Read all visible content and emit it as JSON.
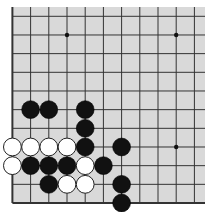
{
  "game": "go",
  "board_view": {
    "description": "Partial Go board, lower-left region with left and bottom edges visible",
    "visible_columns": 11,
    "visible_rows": 11,
    "edges_visible": [
      "left",
      "bottom"
    ],
    "board_color": "#d9d9d9",
    "line_color": "#333333"
  },
  "star_points": [
    {
      "col": 3,
      "row": 1
    },
    {
      "col": 9,
      "row": 1
    },
    {
      "col": 9,
      "row": 7
    }
  ],
  "stones": [
    {
      "color": "black",
      "col": 1,
      "row": 5
    },
    {
      "color": "black",
      "col": 2,
      "row": 5
    },
    {
      "color": "black",
      "col": 4,
      "row": 5
    },
    {
      "color": "black",
      "col": 4,
      "row": 6
    },
    {
      "color": "white",
      "col": 0,
      "row": 7
    },
    {
      "color": "white",
      "col": 1,
      "row": 7
    },
    {
      "color": "white",
      "col": 2,
      "row": 7
    },
    {
      "color": "white",
      "col": 3,
      "row": 7
    },
    {
      "color": "black",
      "col": 4,
      "row": 7
    },
    {
      "color": "black",
      "col": 6,
      "row": 7
    },
    {
      "color": "white",
      "col": 0,
      "row": 8
    },
    {
      "color": "black",
      "col": 1,
      "row": 8
    },
    {
      "color": "black",
      "col": 2,
      "row": 8
    },
    {
      "color": "black",
      "col": 3,
      "row": 8
    },
    {
      "color": "white",
      "col": 4,
      "row": 8
    },
    {
      "color": "black",
      "col": 5,
      "row": 8
    },
    {
      "color": "black",
      "col": 2,
      "row": 9
    },
    {
      "color": "white",
      "col": 3,
      "row": 9
    },
    {
      "color": "white",
      "col": 4,
      "row": 9
    },
    {
      "color": "black",
      "col": 6,
      "row": 9
    },
    {
      "color": "black",
      "col": 6,
      "row": 10
    }
  ]
}
